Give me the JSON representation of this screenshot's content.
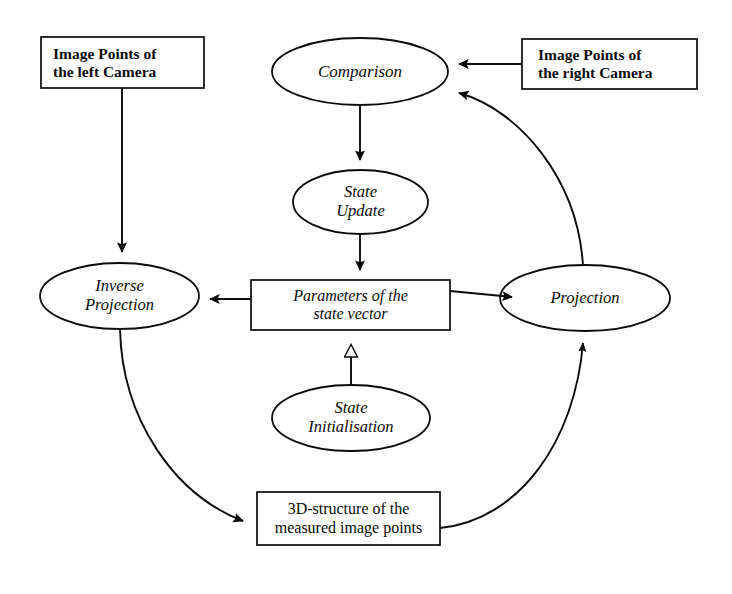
{
  "diagram": {
    "canvas": {
      "width": 732,
      "height": 594
    },
    "colors": {
      "stroke": "#0b0b0b",
      "fill": "#ffffff",
      "text": "#0b0b0b",
      "background": "#ffffff"
    },
    "nodes": [
      {
        "id": "image-points-left-camera",
        "shape": "rectangle",
        "style": "bold",
        "align": "left",
        "lines": [
          "Image Points of",
          "the left Camera"
        ],
        "x": 41,
        "y": 37,
        "w": 163,
        "h": 51,
        "font_size": 15.5
      },
      {
        "id": "image-points-right-camera",
        "shape": "rectangle",
        "style": "bold",
        "align": "left",
        "lines": [
          "Image Points of",
          "the right Camera"
        ],
        "x": 522,
        "y": 39,
        "w": 175,
        "h": 50,
        "font_size": 15.5
      },
      {
        "id": "comparison",
        "shape": "ellipse",
        "style": "italic",
        "align": "center",
        "lines": [
          "Comparison"
        ],
        "x": 272,
        "y": 38,
        "w": 176,
        "h": 67,
        "font_size": 17
      },
      {
        "id": "state-update",
        "shape": "ellipse",
        "style": "italic",
        "align": "center",
        "lines": [
          "State",
          "Update"
        ],
        "x": 293,
        "y": 170,
        "w": 135,
        "h": 64,
        "font_size": 16.5
      },
      {
        "id": "parameters-of-the-state-vector",
        "shape": "rectangle",
        "style": "italic",
        "align": "center",
        "lines": [
          "Parameters of the",
          "state vector"
        ],
        "x": 251,
        "y": 280,
        "w": 199,
        "h": 50,
        "font_size": 16
      },
      {
        "id": "inverse-projection",
        "shape": "ellipse",
        "style": "italic",
        "align": "center",
        "lines": [
          "Inverse",
          "Projection"
        ],
        "x": 40,
        "y": 263,
        "w": 159,
        "h": 66,
        "font_size": 16.5
      },
      {
        "id": "projection",
        "shape": "ellipse",
        "style": "italic",
        "align": "center",
        "lines": [
          "Projection"
        ],
        "x": 500,
        "y": 265,
        "w": 170,
        "h": 66,
        "font_size": 16.5
      },
      {
        "id": "state-initialisation",
        "shape": "ellipse",
        "style": "italic",
        "align": "center",
        "lines": [
          "State",
          "Initialisation"
        ],
        "x": 272,
        "y": 385,
        "w": 158,
        "h": 66,
        "font_size": 16.5
      },
      {
        "id": "3d-structure-of-measured-image-points",
        "shape": "rectangle",
        "style": "regular",
        "align": "center",
        "lines": [
          "3D-structure of the",
          "measured image points"
        ],
        "x": 257,
        "y": 492,
        "w": 183,
        "h": 53,
        "font_size": 16
      }
    ],
    "edges": [
      {
        "id": "left-camera-to-inverse-projection",
        "from": "image-points-left-camera",
        "to": "inverse-projection",
        "kind": "straight",
        "arrow": "solid",
        "label": ""
      },
      {
        "id": "right-camera-to-comparison",
        "from": "image-points-right-camera",
        "to": "comparison",
        "kind": "straight",
        "arrow": "solid",
        "label": ""
      },
      {
        "id": "comparison-to-state-update",
        "from": "comparison",
        "to": "state-update",
        "kind": "straight",
        "arrow": "solid",
        "label": ""
      },
      {
        "id": "state-update-to-parameters",
        "from": "state-update",
        "to": "parameters-of-the-state-vector",
        "kind": "straight",
        "arrow": "solid",
        "label": ""
      },
      {
        "id": "parameters-to-inverse-projection",
        "from": "parameters-of-the-state-vector",
        "to": "inverse-projection",
        "kind": "straight",
        "arrow": "solid",
        "label": ""
      },
      {
        "id": "parameters-to-projection",
        "from": "parameters-of-the-state-vector",
        "to": "projection",
        "kind": "straight",
        "arrow": "solid",
        "label": ""
      },
      {
        "id": "state-initialisation-to-parameters",
        "from": "state-initialisation",
        "to": "parameters-of-the-state-vector",
        "kind": "straight",
        "arrow": "hollow",
        "label": ""
      },
      {
        "id": "inverse-projection-to-3d-structure",
        "from": "inverse-projection",
        "to": "3d-structure-of-measured-image-points",
        "kind": "curved",
        "arrow": "solid",
        "label": ""
      },
      {
        "id": "3d-structure-to-projection",
        "from": "3d-structure-of-measured-image-points",
        "to": "projection",
        "kind": "curved",
        "arrow": "solid",
        "label": ""
      },
      {
        "id": "projection-to-comparison",
        "from": "projection",
        "to": "comparison",
        "kind": "curved",
        "arrow": "solid",
        "label": ""
      }
    ]
  }
}
